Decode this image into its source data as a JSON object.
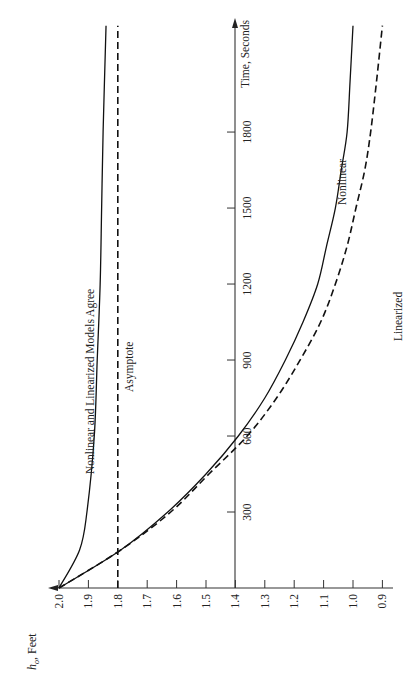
{
  "chart_data": {
    "type": "line",
    "orientation": "rotated-90-ccw",
    "title": "",
    "xlabel": "Time, Seconds",
    "ylabel": "h_o, Feet",
    "xlim": [
      0,
      2250
    ],
    "ylim": [
      0.87,
      2.05
    ],
    "x_ticks": [
      300,
      600,
      900,
      1200,
      1500,
      1800
    ],
    "x_tick_labels": [
      "300",
      "600",
      "900",
      "1200",
      "1500",
      "1800"
    ],
    "y_ticks": [
      2.0,
      1.9,
      1.8,
      1.7,
      1.6,
      1.5,
      1.4,
      1.3,
      1.2,
      1.1,
      1.0,
      0.9
    ],
    "y_tick_labels": [
      "2.0",
      "1.9",
      "1.8",
      "1.7",
      "1.6",
      "1.5",
      "1.4",
      "1.3",
      "1.2",
      "1.1",
      "1.0",
      "0.9"
    ],
    "grid": false,
    "series": [
      {
        "name": "Nonlinear and Linearized Models Agree",
        "style": "solid",
        "x": [
          0,
          150,
          300,
          600,
          900,
          1200,
          1500,
          1800,
          2220
        ],
        "values": [
          2.0,
          1.93,
          1.905,
          1.88,
          1.87,
          1.86,
          1.855,
          1.85,
          1.84
        ]
      },
      {
        "name": "Asymptote",
        "style": "dashed",
        "x": [
          0,
          2220
        ],
        "values": [
          1.8,
          1.8
        ]
      },
      {
        "name": "Nonlinear",
        "style": "solid",
        "x": [
          0,
          150,
          300,
          450,
          600,
          750,
          900,
          1050,
          1200,
          1350,
          1500,
          1650,
          1800,
          2000,
          2220
        ],
        "values": [
          2.0,
          1.79,
          1.63,
          1.5,
          1.39,
          1.3,
          1.23,
          1.17,
          1.12,
          1.09,
          1.06,
          1.04,
          1.02,
          1.01,
          1.0
        ]
      },
      {
        "name": "Linearized",
        "style": "dashed",
        "x": [
          0,
          150,
          300,
          450,
          600,
          750,
          900,
          1050,
          1200,
          1350,
          1500,
          1650,
          1800,
          2000,
          2220
        ],
        "values": [
          2.0,
          1.79,
          1.62,
          1.49,
          1.36,
          1.26,
          1.18,
          1.11,
          1.06,
          1.02,
          0.99,
          0.96,
          0.94,
          0.92,
          0.9
        ]
      }
    ],
    "annotations": [
      "Nonlinear and Linearized Models Agree",
      "Asymptote",
      "Nonlinear",
      "Linearized"
    ]
  },
  "labels": {
    "time_axis": "Time, Seconds",
    "h_axis_symbol": "h",
    "h_axis_sub": "o",
    "h_axis_unit": ", Feet",
    "agree": "Nonlinear and Linearized Models Agree",
    "asymptote": "Asymptote",
    "nonlinear": "Nonlinear",
    "linearized": "Linearized"
  }
}
